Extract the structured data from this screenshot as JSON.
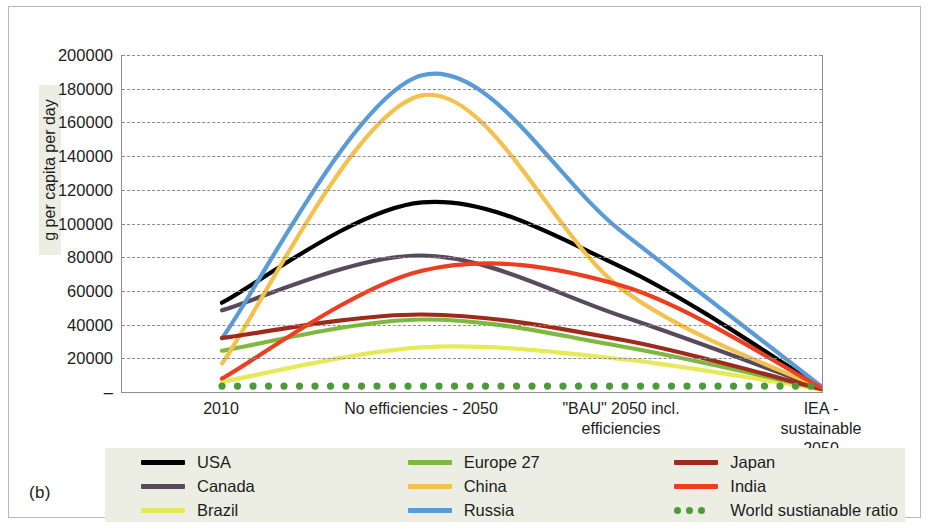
{
  "figure": {
    "panel_label": "(b)",
    "background": "#ffffff",
    "frame_color": "#b9b9b9",
    "legend_background": "#eceee4"
  },
  "chart_data": {
    "type": "line",
    "title": "",
    "xlabel": "",
    "ylabel": "g per capita per day",
    "ylim": [
      0,
      200000
    ],
    "ytick_values": [
      0,
      20000,
      40000,
      60000,
      80000,
      100000,
      120000,
      140000,
      160000,
      180000,
      200000
    ],
    "ytick_labels": [
      "–",
      "20000",
      "40000",
      "60000",
      "80000",
      "100000",
      "120000",
      "140000",
      "160000",
      "180000",
      "200000"
    ],
    "grid": true,
    "grid_style": "dashed-horizontal",
    "legend_position": "bottom",
    "categories": [
      "2010",
      "No efficiencies - 2050",
      "\"BAU\" 2050 incl. efficiencies",
      "IEA - sustainable 2050"
    ],
    "xtick_labels": [
      "2010",
      "No efficiencies - 2050",
      "\"BAU\" 2050 incl.\nefficiencies",
      "IEA - sustainable 2050"
    ],
    "x": [
      0,
      1,
      2,
      3
    ],
    "series": [
      {
        "name": "USA",
        "color": "#000000",
        "style": "solid",
        "values": [
          53000,
          112500,
          74000,
          2500
        ]
      },
      {
        "name": "Canada",
        "color": "#574a5c",
        "style": "solid",
        "values": [
          48500,
          81000,
          45000,
          2200
        ]
      },
      {
        "name": "Brazil",
        "color": "#e6ea5a",
        "style": "solid",
        "values": [
          6000,
          26500,
          19500,
          1500
        ]
      },
      {
        "name": "Europe 27",
        "color": "#7eb83f",
        "style": "solid",
        "values": [
          24500,
          43000,
          27000,
          1800
        ]
      },
      {
        "name": "China",
        "color": "#f3c14e",
        "style": "solid",
        "values": [
          17000,
          176000,
          61000,
          2000
        ]
      },
      {
        "name": "Russia",
        "color": "#5b9bd5",
        "style": "solid",
        "values": [
          32000,
          188000,
          95000,
          3000
        ]
      },
      {
        "name": "Japan",
        "color": "#9e2a1b",
        "style": "solid",
        "values": [
          32000,
          46000,
          31000,
          1700
        ]
      },
      {
        "name": "India",
        "color": "#ea3f23",
        "style": "solid",
        "values": [
          8000,
          72000,
          63000,
          2400
        ]
      },
      {
        "name": "World sustainable ratio",
        "color": "#4e9a3b",
        "style": "dotted",
        "values": [
          3500,
          3500,
          3500,
          3500
        ]
      }
    ]
  },
  "legend": {
    "columns": [
      [
        {
          "label": "USA",
          "color": "#000000",
          "style": "solid"
        },
        {
          "label": "Canada",
          "color": "#574a5c",
          "style": "solid"
        },
        {
          "label": "Brazil",
          "color": "#e6ea5a",
          "style": "solid"
        }
      ],
      [
        {
          "label": "Europe 27",
          "color": "#7eb83f",
          "style": "solid"
        },
        {
          "label": "China",
          "color": "#f3c14e",
          "style": "solid"
        },
        {
          "label": "Russia",
          "color": "#5b9bd5",
          "style": "solid"
        }
      ],
      [
        {
          "label": "Japan",
          "color": "#9e2a1b",
          "style": "solid"
        },
        {
          "label": "India",
          "color": "#ea3f23",
          "style": "solid"
        },
        {
          "label": "World sustianable ratio",
          "color": "#4e9a3b",
          "style": "dotted"
        }
      ]
    ]
  }
}
